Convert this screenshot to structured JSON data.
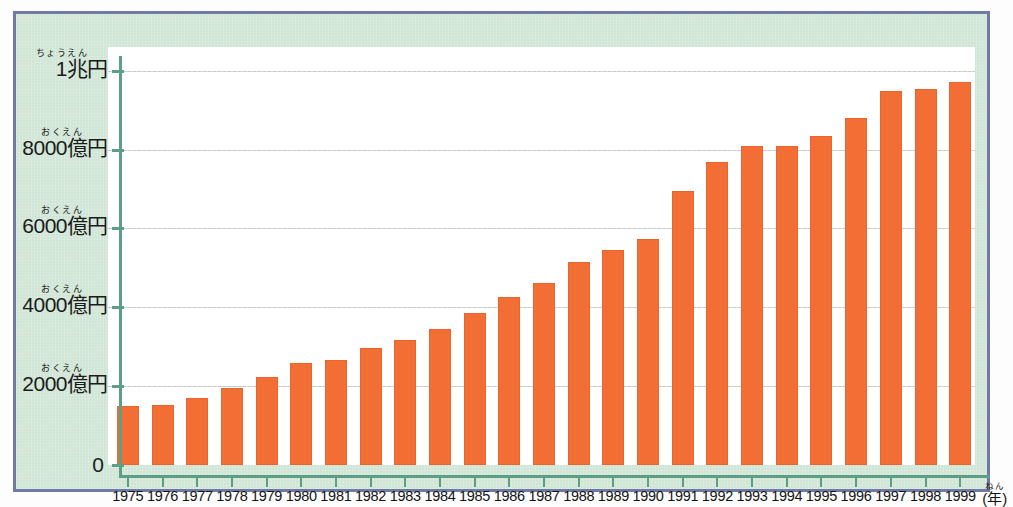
{
  "chart_data": {
    "type": "bar",
    "title": "",
    "subtitle": "",
    "xlabel": "年",
    "xlabel_ruby": "ねん",
    "ylabel": "",
    "grid": true,
    "legend": false,
    "ylim": [
      0,
      10600
    ],
    "y_unit_note": "億円 (hundred million yen); 1兆円 = 10000億円",
    "categories": [
      "1975",
      "1976",
      "1977",
      "1978",
      "1979",
      "1980",
      "1981",
      "1982",
      "1983",
      "1984",
      "1985",
      "1986",
      "1987",
      "1988",
      "1989",
      "1990",
      "1991",
      "1992",
      "1993",
      "1994",
      "1995",
      "1996",
      "1997",
      "1998",
      "1999"
    ],
    "values": [
      1500,
      1530,
      1690,
      1960,
      2240,
      2580,
      2660,
      2970,
      3180,
      3460,
      3860,
      4250,
      4610,
      5140,
      5460,
      5730,
      6960,
      7680,
      8100,
      8080,
      8350,
      8790,
      9480,
      9530,
      9720
    ],
    "yticks": [
      {
        "value": 0,
        "text": "0",
        "ruby": ""
      },
      {
        "value": 2000,
        "text": "2000億円",
        "ruby": "おくえん"
      },
      {
        "value": 4000,
        "text": "4000億円",
        "ruby": "おくえん"
      },
      {
        "value": 6000,
        "text": "6000億円",
        "ruby": "おくえん"
      },
      {
        "value": 8000,
        "text": "8000億円",
        "ruby": "おくえん"
      },
      {
        "value": 10000,
        "text": "1兆円",
        "ruby": "ちょうえん"
      }
    ],
    "colors": {
      "bar": "#f26e35",
      "plot_background": "#ffffff",
      "panel_background": "#cfe5d5",
      "frame_border": "#6f7ba4",
      "axis": "#5d9e86",
      "gridline": "#c9ccc6",
      "text": "#1b1b1b"
    }
  }
}
